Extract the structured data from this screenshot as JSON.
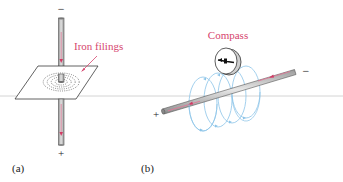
{
  "figure": {
    "panel_a": {
      "label": "(a)",
      "annotation": "Iron filings",
      "top_terminal": "−",
      "bottom_terminal": "+"
    },
    "panel_b": {
      "label": "(b)",
      "annotation": "Compass",
      "left_terminal": "+",
      "right_terminal": "−"
    }
  },
  "colors": {
    "annotation": "#d6456e",
    "current_arrow": "#d23a64",
    "field_lines": "#8cc4e8",
    "wire": "#b9b9b9",
    "outline": "#3a3a3a"
  }
}
